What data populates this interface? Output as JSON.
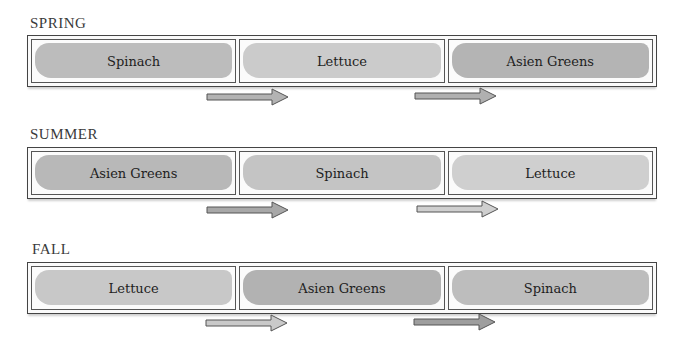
{
  "colors": {
    "wash_light": "#c9c9c9",
    "wash_mid": "#bdbdbd",
    "wash_dark": "#acacac",
    "border": "#444444",
    "arrow_fill": "#a9a9a9",
    "arrow_fill_light": "#d5d5d5"
  },
  "rows": [
    {
      "season": "SPRING",
      "cells": [
        {
          "label": "Spinach",
          "shade": "#bcbcbc"
        },
        {
          "label": "Lettuce",
          "shade": "#cbcbcb"
        },
        {
          "label": "Asien Greens",
          "shade": "#b4b4b4"
        }
      ],
      "arrows": [
        "arrow-right",
        "arrow-right"
      ]
    },
    {
      "season": "SUMMER",
      "cells": [
        {
          "label": "Asien Greens",
          "shade": "#b8b8b8"
        },
        {
          "label": "Spinach",
          "shade": "#c4c4c4"
        },
        {
          "label": "Lettuce",
          "shade": "#cfcfcf"
        }
      ],
      "arrows": [
        "arrow-right",
        "arrow-right"
      ]
    },
    {
      "season": "FALL",
      "cells": [
        {
          "label": "Lettuce",
          "shade": "#c8c8c8"
        },
        {
          "label": "Asien Greens",
          "shade": "#b2b2b2"
        },
        {
          "label": "Spinach",
          "shade": "#bdbdbd"
        }
      ],
      "arrows": [
        "arrow-right",
        "arrow-right"
      ]
    }
  ]
}
